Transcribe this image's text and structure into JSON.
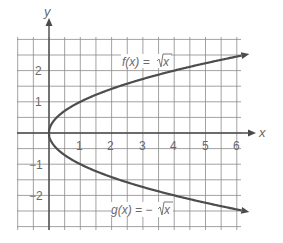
{
  "chart_data": {
    "type": "line",
    "title": "",
    "xlabel": "x",
    "ylabel": "y",
    "xlim": [
      -1,
      6.25
    ],
    "ylim": [
      -3,
      3.1
    ],
    "grid": true,
    "grid_step": 0.5,
    "x_ticks": [
      "1",
      "2",
      "3",
      "4",
      "5",
      "6"
    ],
    "y_ticks": [
      "2",
      "1",
      "-1",
      "-2"
    ],
    "series": [
      {
        "name": "f(x) = √x",
        "label_text": "f(x) = √x",
        "x": [
          0,
          0.25,
          1,
          2,
          3,
          4,
          5,
          6,
          6.25
        ],
        "values": [
          0,
          0.5,
          1,
          1.414,
          1.732,
          2,
          2.236,
          2.449,
          2.5
        ]
      },
      {
        "name": "g(x) = −√x",
        "label_text": "g(x) = −√x",
        "x": [
          0,
          0.25,
          1,
          2,
          3,
          4,
          5,
          6,
          6.25
        ],
        "values": [
          0,
          -0.5,
          -1,
          -1.414,
          -1.732,
          -2,
          -2.236,
          -2.449,
          -2.5
        ]
      }
    ],
    "annotations": [
      {
        "text": "f(x) = √x",
        "position": "above upper curve near x≈3"
      },
      {
        "text": "g(x) = −√x",
        "position": "below lower curve near x≈3"
      }
    ],
    "legend": "none (inline labels)"
  },
  "labels": {
    "x_axis": "x",
    "y_axis": "y",
    "f_label_prefix": "f(x) = ",
    "f_label_radical": "x",
    "g_label_prefix": "g(x) = −",
    "g_label_radical": "x",
    "x_tick_1": "1",
    "x_tick_2": "2",
    "x_tick_3": "3",
    "x_tick_4": "4",
    "x_tick_5": "5",
    "x_tick_6": "6",
    "y_tick_2": "2",
    "y_tick_1": "1",
    "y_tick_m1": "−1",
    "y_tick_m2": "−2"
  }
}
